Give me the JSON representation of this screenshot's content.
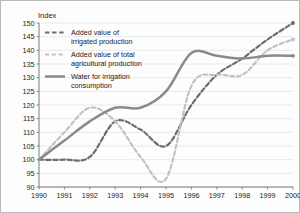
{
  "chart_data": {
    "type": "line",
    "title": "",
    "xlabel": "",
    "ylabel": "Index",
    "ylim": [
      90,
      150
    ],
    "ytick_step": 5,
    "yticks": [
      90,
      95,
      100,
      105,
      110,
      115,
      120,
      125,
      130,
      135,
      140,
      145,
      150
    ],
    "xlim": [
      1990,
      2000
    ],
    "grid": true,
    "legend_position": "top-left inside plot",
    "x": [
      1990,
      1991,
      1992,
      1993,
      1994,
      1995,
      1996,
      1997,
      1998,
      1999,
      2000
    ],
    "categories": [
      "1990",
      "1991",
      "1992",
      "1993",
      "1994",
      "1995",
      "1996",
      "1997",
      "1998",
      "1999",
      "2000"
    ],
    "series": [
      {
        "name": "Added value of irrigated production",
        "style": "dashed",
        "color": "#6d6d6d",
        "values": [
          100,
          100,
          101,
          114,
          111,
          105,
          120,
          131,
          137,
          144,
          150
        ]
      },
      {
        "name": "Added value of total agricultural production",
        "style": "dashed-light",
        "color": "#c2c2c2",
        "values": [
          100,
          110,
          119,
          114,
          101,
          93,
          127,
          131,
          131,
          140,
          144
        ]
      },
      {
        "name": "Water for irrigation consumption",
        "style": "solid",
        "color": "#8a8a8a",
        "values": [
          100,
          107,
          114,
          119,
          119,
          125,
          139,
          138,
          137,
          138,
          138
        ]
      }
    ]
  },
  "legend": {
    "items": [
      {
        "label_line1": "Added value of",
        "label_line2": "irrigated production",
        "swatch": "dashed-dark-swatch"
      },
      {
        "label_line1": "Added value of total",
        "label_line2": "agricultural production",
        "swatch": "dashed-light-swatch"
      },
      {
        "label_line1": "Water for irrigation",
        "label_line2": "consumption",
        "swatch": "solid-gray-swatch"
      }
    ]
  },
  "axes": {
    "y_axis_title": "Index",
    "y_tick_labels": [
      "150",
      "145",
      "140",
      "135",
      "130",
      "125",
      "120",
      "115",
      "110",
      "105",
      "100",
      "95",
      "90"
    ],
    "x_tick_labels": [
      "1990",
      "1991",
      "1992",
      "1993",
      "1994",
      "1995",
      "1996",
      "1997",
      "1998",
      "1999",
      "2000"
    ]
  },
  "colors": {
    "irrigated_production": "#6d6d6d",
    "total_agricultural_production": "#c2c2c2",
    "water_irrigation": "#8a8a8a",
    "grid": "#d8dde6",
    "axis": "#6e6e6e",
    "text": "#1c1c1c"
  }
}
